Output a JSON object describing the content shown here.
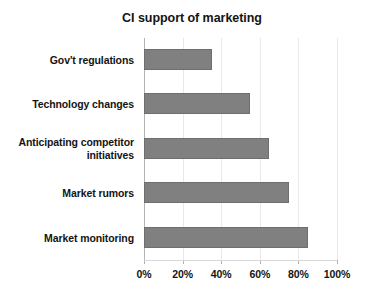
{
  "chart_data": {
    "type": "bar",
    "orientation": "horizontal",
    "title": "CI support of marketing",
    "xlabel": "",
    "ylabel": "",
    "categories": [
      "Gov't regulations",
      "Technology changes",
      "Anticipating competitor initiatives",
      "Market rumors",
      "Market monitoring"
    ],
    "values": [
      35,
      55,
      65,
      75,
      85
    ],
    "value_unit": "%",
    "xlim": [
      0,
      100
    ],
    "xticks": [
      0,
      20,
      40,
      60,
      80,
      100
    ],
    "xtick_labels": [
      "0%",
      "20%",
      "40%",
      "60%",
      "80%",
      "100%"
    ],
    "grid": true,
    "grid_axis": "x",
    "legend": false,
    "legend_position": "none",
    "bar_color": "#808080",
    "bar_edge_color": "#6e6e6e",
    "background_color": "#ffffff",
    "gridline_color": "#e9e9e9",
    "axis_color": "#b4b4b4",
    "text_color": "#141414",
    "category_order": "top-to-bottom"
  }
}
